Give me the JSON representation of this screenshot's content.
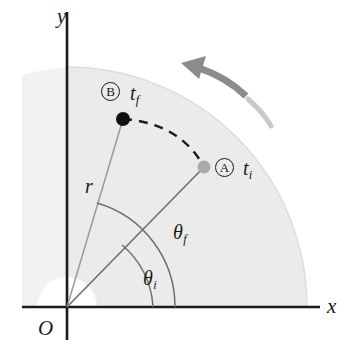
{
  "figure": {
    "type": "physics-diagram",
    "width": 358,
    "height": 359,
    "background_color": "#ffffff",
    "disc_fill_color": "#ebebeb",
    "disc_edge_color": "#d8d8d8",
    "hub_fill_color": "#ffffff",
    "axis_color": "#1a1a1a",
    "radius_line_color": "#9a9a9a",
    "arc_line_color": "#6f6f6f",
    "dashed_arc_color": "#1a1a1a",
    "arrow_color": "#8c8c8c",
    "point_b_color": "#111111",
    "point_a_color": "#aaaaaa"
  },
  "axes": {
    "x_label": "x",
    "y_label": "y",
    "origin_label": "O",
    "origin_x": 67,
    "origin_y": 307
  },
  "geometry": {
    "disc_radius": 240,
    "hub_radius": 30,
    "radius_length": 215,
    "theta_i_deg": 30,
    "theta_f_deg": 60,
    "theta_f_arc_radius": 108,
    "theta_i_arc_radius": 86
  },
  "points": [
    {
      "tag": "A",
      "time_label": "t",
      "time_subscript": "i",
      "angle_deg": 30,
      "x": 204,
      "y": 167,
      "dot_color": "#aaaaaa",
      "dot_radius": 6.5,
      "description": "initial position of reference line at time t sub i"
    },
    {
      "tag": "B",
      "time_label": "t",
      "time_subscript": "f",
      "angle_deg": 60,
      "x": 123,
      "y": 119,
      "dot_color": "#111111",
      "dot_radius": 7,
      "description": "final position of reference line at time t sub f"
    }
  ],
  "labels": {
    "radius": {
      "text": "r",
      "subscript": ""
    },
    "theta_final": {
      "text": "θ",
      "subscript": "f"
    },
    "theta_initial": {
      "text": "θ",
      "subscript": "i"
    },
    "time_final": {
      "text": "t",
      "subscript": "f"
    },
    "time_initial": {
      "text": "t",
      "subscript": "i"
    }
  },
  "rotation_arrow": {
    "direction": "counterclockwise",
    "description": "curved gray arrow above the disc indicating counterclockwise rotation"
  },
  "dashed_arc": {
    "description": "dashed arc showing angular displacement swept from point A to point B",
    "from": "A",
    "to": "B"
  }
}
